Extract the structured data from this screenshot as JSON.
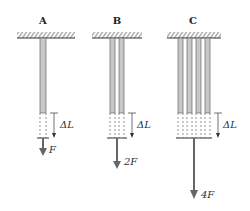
{
  "panels": [
    {
      "label": "A",
      "force": "F",
      "delta": "ΔL"
    },
    {
      "label": "B",
      "force": "2F",
      "delta": "ΔL"
    },
    {
      "label": "C",
      "force": "4F",
      "delta": "ΔL"
    }
  ],
  "colors": {
    "rod": "#c8c8c8",
    "rod_edge": "#666666",
    "arrow": "#666666",
    "line": "#333333"
  }
}
